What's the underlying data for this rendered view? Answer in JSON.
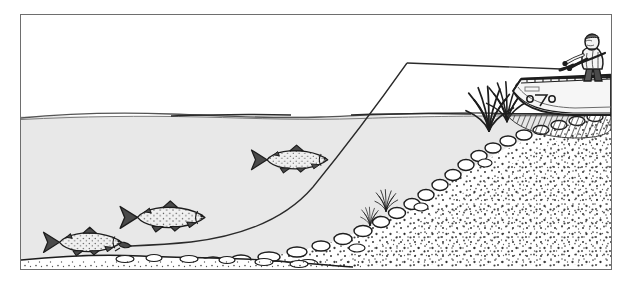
{
  "illustration": {
    "title": "Trout fishing from a boat over a sloping gravel shoreline",
    "medium": "pen-and-ink line drawing",
    "frame": {
      "x": 20,
      "y": 14,
      "width": 592,
      "height": 256,
      "border_color": "#6e6e6e",
      "background": "#ffffff"
    },
    "palette": {
      "ink": "#1d1d1d",
      "line_gray": "#4a4a4a",
      "water_fill": "#e8e8e8",
      "water_surface_line": "#555555",
      "sky_fill": "#ffffff",
      "gravel_fill": "#ffffff",
      "stipple": "#1d1d1d",
      "boat_fill": "#f2f2f2",
      "reflection_hatch": "#3a3a3a",
      "fish_body": "#f0f0f0",
      "fish_fin": "#3a3a3a"
    },
    "regions": [
      {
        "name": "sky-above-water",
        "fill": "#ffffff",
        "description": "blank white air above the waterline"
      },
      {
        "name": "water-body",
        "fill": "#e8e8e8",
        "description": "pale gray lake water filling the lower left two thirds"
      },
      {
        "name": "waterline",
        "y": 101,
        "description": "horizontal ripple line running the full width"
      },
      {
        "name": "shore-slope",
        "description": "gravel bank rising from lower-left to upper-right"
      },
      {
        "name": "lake-bottom",
        "description": "white gravel bed strip along the bottom of the water"
      }
    ],
    "elements": [
      {
        "name": "boat",
        "label": "rowboat",
        "x": 512,
        "y": 72,
        "width": 100,
        "height": 34
      },
      {
        "name": "boat-reflection",
        "label": "hatched reflection under hull",
        "x": 508,
        "y": 100,
        "width": 104,
        "height": 22
      },
      {
        "name": "angler",
        "label": "standing fisherman",
        "x": 556,
        "y": 24,
        "width": 36,
        "height": 52
      },
      {
        "name": "fishing-rod",
        "label": "fishing rod",
        "from": [
          536,
          58
        ],
        "to": [
          580,
          40
        ]
      },
      {
        "name": "fishing-line",
        "label": "line curving from rod tip down through the water to the lure",
        "rod_tip": [
          405,
          62
        ],
        "lure_end": [
          128,
          232
        ]
      },
      {
        "name": "lure",
        "label": "small lure / fly at the end of the line",
        "x": 122,
        "y": 228
      },
      {
        "name": "grass-tuft-large",
        "label": "grass clump on the waterline",
        "x": 472,
        "y": 100
      },
      {
        "name": "grass-tuft-small",
        "label": "small grass clump on the bank",
        "x": 382,
        "y": 197
      }
    ],
    "fish": [
      {
        "name": "trout-1",
        "label": "trout (lowest, far left)",
        "x": 36,
        "y": 219,
        "length": 62,
        "heading": "left"
      },
      {
        "name": "trout-2",
        "label": "trout (middle left)",
        "x": 112,
        "y": 196,
        "length": 70,
        "heading": "left"
      },
      {
        "name": "trout-3",
        "label": "trout (upper, center)",
        "x": 246,
        "y": 142,
        "length": 58,
        "heading": "left"
      }
    ],
    "counts": {
      "fish": 3,
      "anglers": 1,
      "boats": 1
    }
  }
}
